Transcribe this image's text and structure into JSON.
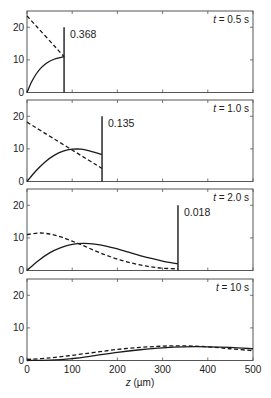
{
  "chart_data": [
    {
      "type": "line",
      "panel_label": "t = 0.5 s",
      "time_italic": "t",
      "time_value": "= 0.5 s",
      "annotation": "0.368",
      "front_z": 82,
      "xlim": [
        0,
        500
      ],
      "ylim": [
        0,
        25
      ],
      "yticks": [
        0,
        10,
        20
      ],
      "series": [
        {
          "name": "solid",
          "style": "solid",
          "x": [
            0,
            10,
            20,
            30,
            40,
            50,
            60,
            70,
            82
          ],
          "y": [
            0,
            3.2,
            5.6,
            7.4,
            8.7,
            9.6,
            10.2,
            10.6,
            11
          ]
        },
        {
          "name": "dashed",
          "style": "dashed",
          "x": [
            0,
            82
          ],
          "y": [
            23.5,
            11
          ]
        }
      ],
      "front_line": {
        "z": 82,
        "y_top": 20
      }
    },
    {
      "type": "line",
      "panel_label": "t = 1.0 s",
      "time_italic": "t",
      "time_value": "= 1.0 s",
      "annotation": "0.135",
      "front_z": 166,
      "xlim": [
        0,
        500
      ],
      "ylim": [
        0,
        25
      ],
      "yticks": [
        0,
        10,
        20
      ],
      "series": [
        {
          "name": "solid",
          "style": "solid",
          "x": [
            0,
            20,
            40,
            60,
            80,
            100,
            120,
            140,
            166
          ],
          "y": [
            0,
            3.3,
            6.0,
            8.0,
            9.3,
            9.9,
            9.9,
            9.3,
            8.3
          ]
        },
        {
          "name": "dashed",
          "style": "dashed",
          "x": [
            0,
            166
          ],
          "y": [
            18.2,
            4
          ]
        }
      ],
      "front_line": {
        "z": 166,
        "y_top": 20
      }
    },
    {
      "type": "line",
      "panel_label": "t = 2.0 s",
      "time_italic": "t",
      "time_value": "= 2.0 s",
      "annotation": "0.018",
      "front_z": 334,
      "xlim": [
        0,
        500
      ],
      "ylim": [
        0,
        25
      ],
      "yticks": [
        0,
        10,
        20
      ],
      "series": [
        {
          "name": "solid",
          "style": "solid",
          "x": [
            0,
            25,
            50,
            75,
            100,
            125,
            150,
            175,
            200,
            225,
            250,
            275,
            300,
            334
          ],
          "y": [
            0,
            3.0,
            5.4,
            7.0,
            8.0,
            8.3,
            8.1,
            7.5,
            6.6,
            5.6,
            4.6,
            3.7,
            2.9,
            2.0
          ]
        },
        {
          "name": "dashed",
          "style": "dashed",
          "x": [
            0,
            25,
            50,
            75,
            100,
            125,
            150,
            175,
            200,
            225,
            250,
            275,
            300,
            334
          ],
          "y": [
            11,
            11.5,
            11.2,
            10.3,
            9.0,
            7.6,
            6.1,
            4.7,
            3.5,
            2.5,
            1.7,
            1.1,
            0.7,
            0.5
          ]
        }
      ],
      "front_line": {
        "z": 334,
        "y_top": 20
      }
    },
    {
      "type": "line",
      "panel_label": "t = 10 s",
      "time_italic": "t",
      "time_value": "= 10 s",
      "annotation": "",
      "xlim": [
        0,
        500
      ],
      "ylim": [
        0,
        25
      ],
      "yticks": [
        0,
        10,
        20
      ],
      "xticks": [
        0,
        100,
        200,
        300,
        400,
        500
      ],
      "xlabel": "z (µm)",
      "series": [
        {
          "name": "solid",
          "style": "solid",
          "x": [
            0,
            50,
            100,
            150,
            200,
            250,
            300,
            350,
            400,
            450,
            500
          ],
          "y": [
            0,
            0.1,
            0.6,
            1.5,
            2.5,
            3.3,
            3.9,
            4.2,
            4.2,
            4.0,
            3.6
          ]
        },
        {
          "name": "dashed",
          "style": "dashed",
          "x": [
            0,
            50,
            100,
            150,
            200,
            250,
            300,
            350,
            400,
            450,
            500
          ],
          "y": [
            0.3,
            0.8,
            1.6,
            2.5,
            3.4,
            4.0,
            4.4,
            4.5,
            4.2,
            3.6,
            3.0
          ]
        }
      ]
    }
  ],
  "axes": {
    "ytick_labels": [
      "0",
      "10",
      "20"
    ],
    "xtick_labels": [
      "0",
      "100",
      "200",
      "300",
      "400",
      "500"
    ],
    "xlabel_italic": "z",
    "xlabel_unit": "(µm)"
  },
  "colors": {
    "line": "#1a1a1a",
    "frame": "#555555",
    "background": "#ffffff"
  }
}
